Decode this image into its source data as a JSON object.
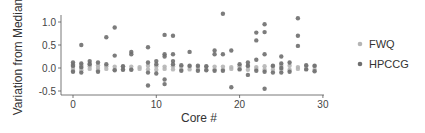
{
  "chart_data": {
    "type": "scatter",
    "title": "",
    "xlabel": "Core #",
    "ylabel": "Variation from Median",
    "xlim": [
      -1.5,
      30.2
    ],
    "ylim": [
      -0.58,
      1.28
    ],
    "xticks": [
      0,
      10,
      20,
      30
    ],
    "yticks": [
      -0.5,
      0.0,
      0.5,
      1.0
    ],
    "xtick_labels": [
      "0",
      "10",
      "20",
      "30"
    ],
    "ytick_labels": [
      "-0.5",
      "0.0",
      "0.5",
      "1.0"
    ],
    "grid": false,
    "legend_position": "right",
    "series": [
      {
        "name": "FWQ",
        "color": "#b5b5b5",
        "points": [
          [
            0,
            0.08
          ],
          [
            0,
            0.03
          ],
          [
            0,
            -0.02
          ],
          [
            0,
            -0.06
          ],
          [
            1,
            0.06
          ],
          [
            1,
            0.0
          ],
          [
            1,
            -0.05
          ],
          [
            2,
            0.1
          ],
          [
            2,
            0.04
          ],
          [
            2,
            -0.02
          ],
          [
            3,
            0.06
          ],
          [
            3,
            0.0
          ],
          [
            3,
            -0.05
          ],
          [
            4,
            0.04
          ],
          [
            4,
            -0.02
          ],
          [
            5,
            0.03
          ],
          [
            5,
            -0.03
          ],
          [
            6,
            0.03
          ],
          [
            6,
            -0.03
          ],
          [
            7,
            0.03
          ],
          [
            7,
            -0.03
          ],
          [
            8,
            0.02
          ],
          [
            8,
            -0.02
          ],
          [
            9,
            0.05
          ],
          [
            9,
            -0.03
          ],
          [
            10,
            0.04
          ],
          [
            10,
            -0.04
          ],
          [
            11,
            0.03
          ],
          [
            11,
            -0.02
          ],
          [
            12,
            0.04
          ],
          [
            12,
            -0.03
          ],
          [
            13,
            0.03
          ],
          [
            13,
            -0.03
          ],
          [
            14,
            0.03
          ],
          [
            14,
            -0.03
          ],
          [
            15,
            0.02
          ],
          [
            15,
            -0.02
          ],
          [
            16,
            0.03
          ],
          [
            16,
            -0.03
          ],
          [
            17,
            0.03
          ],
          [
            17,
            -0.03
          ],
          [
            18,
            0.03
          ],
          [
            18,
            -0.03
          ],
          [
            19,
            0.02
          ],
          [
            19,
            -0.02
          ],
          [
            20,
            0.04
          ],
          [
            20,
            -0.02
          ],
          [
            21,
            0.04
          ],
          [
            21,
            -0.04
          ],
          [
            22,
            0.02
          ],
          [
            22,
            -0.02
          ],
          [
            23,
            0.04
          ],
          [
            23,
            -0.04
          ],
          [
            24,
            0.04
          ],
          [
            24,
            -0.04
          ],
          [
            25,
            0.05
          ],
          [
            25,
            -0.04
          ],
          [
            26,
            0.05
          ],
          [
            26,
            -0.04
          ],
          [
            27,
            0.02
          ],
          [
            27,
            -0.02
          ],
          [
            28,
            0.04
          ],
          [
            28,
            -0.02
          ],
          [
            29,
            0.04
          ],
          [
            29,
            -0.04
          ]
        ]
      },
      {
        "name": "HPCCG",
        "color": "#6e6e6e",
        "points": [
          [
            0,
            0.12
          ],
          [
            0,
            0.05
          ],
          [
            0,
            -0.08
          ],
          [
            1,
            0.5
          ],
          [
            1,
            0.1
          ],
          [
            1,
            0.02
          ],
          [
            1,
            -0.1
          ],
          [
            2,
            0.15
          ],
          [
            2,
            0.08
          ],
          [
            3,
            0.12
          ],
          [
            3,
            -0.08
          ],
          [
            4,
            0.67
          ],
          [
            4,
            0.08
          ],
          [
            5,
            0.88
          ],
          [
            5,
            0.27
          ],
          [
            5,
            -0.05
          ],
          [
            6,
            0.04
          ],
          [
            6,
            -0.04
          ],
          [
            7,
            0.35
          ],
          [
            7,
            0.3
          ],
          [
            7,
            -0.04
          ],
          [
            9,
            0.45
          ],
          [
            9,
            0.12
          ],
          [
            9,
            -0.1
          ],
          [
            9,
            -0.38
          ],
          [
            10,
            0.15
          ],
          [
            10,
            0.08
          ],
          [
            10,
            -0.12
          ],
          [
            11,
            0.72
          ],
          [
            11,
            0.3
          ],
          [
            11,
            0.25
          ],
          [
            11,
            -0.25
          ],
          [
            11,
            -0.35
          ],
          [
            12,
            0.7
          ],
          [
            12,
            0.3
          ],
          [
            12,
            0.15
          ],
          [
            12,
            0.08
          ],
          [
            13,
            0.06
          ],
          [
            13,
            -0.06
          ],
          [
            14,
            0.35
          ],
          [
            14,
            0.05
          ],
          [
            15,
            0.05
          ],
          [
            15,
            -0.06
          ],
          [
            16,
            0.04
          ],
          [
            16,
            -0.05
          ],
          [
            17,
            0.38
          ],
          [
            17,
            0.3
          ],
          [
            17,
            -0.06
          ],
          [
            18,
            1.18
          ],
          [
            18,
            0.3
          ],
          [
            18,
            -0.06
          ],
          [
            19,
            0.38
          ],
          [
            19,
            -0.42
          ],
          [
            20,
            0.08
          ],
          [
            20,
            -0.03
          ],
          [
            21,
            0.12
          ],
          [
            21,
            0.05
          ],
          [
            21,
            -0.15
          ],
          [
            22,
            0.77
          ],
          [
            22,
            0.6
          ],
          [
            22,
            0.18
          ],
          [
            22,
            -0.06
          ],
          [
            23,
            0.95
          ],
          [
            23,
            0.78
          ],
          [
            23,
            0.3
          ],
          [
            23,
            -0.08
          ],
          [
            23,
            -0.45
          ],
          [
            24,
            0.05
          ],
          [
            24,
            -0.1
          ],
          [
            25,
            0.25
          ],
          [
            25,
            0.1
          ],
          [
            25,
            0.0
          ],
          [
            25,
            -0.1
          ],
          [
            26,
            0.12
          ],
          [
            26,
            -0.08
          ],
          [
            27,
            1.08
          ],
          [
            27,
            0.7
          ],
          [
            27,
            0.48
          ],
          [
            28,
            0.06
          ],
          [
            28,
            -0.03
          ],
          [
            29,
            0.05
          ],
          [
            29,
            -0.07
          ]
        ]
      }
    ]
  },
  "legend": {
    "items": [
      {
        "label": "FWQ",
        "color": "#b5b5b5"
      },
      {
        "label": "HPCCG",
        "color": "#6e6e6e"
      }
    ]
  },
  "axes": {
    "x_title": "Core #",
    "y_title": "Variation from Median"
  }
}
